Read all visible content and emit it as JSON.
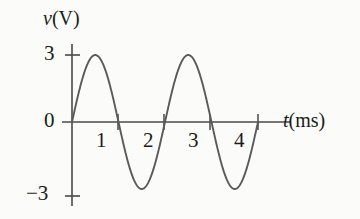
{
  "figure": {
    "background_color": "#fbfbf9",
    "ink_color": "#4a4a4a",
    "text_color": "#1b1b1b"
  },
  "labels": {
    "y_axis_title_symbol": "v",
    "y_axis_title_unit": "(V)",
    "x_axis_title_symbol": "t",
    "x_axis_title_unit": "(ms)",
    "y_tick_pos": "3",
    "y_tick_zero": "0",
    "y_tick_neg": "−3",
    "x_tick_1": "1",
    "x_tick_2": "2",
    "x_tick_3": "3",
    "x_tick_4": "4"
  },
  "chart_data": {
    "type": "line",
    "title": "",
    "subtitle": "",
    "xlabel": "t(ms)",
    "ylabel": "v(V)",
    "xlim": [
      0,
      4.6
    ],
    "ylim": [
      -3.6,
      3.6
    ],
    "xticks": [
      1,
      2,
      3,
      4
    ],
    "yticks": [
      -3,
      0,
      3
    ],
    "xtick_labels": [
      "1",
      "2",
      "3",
      "4"
    ],
    "ytick_labels": [
      "−3",
      "0",
      "3"
    ],
    "grid": false,
    "legend": null,
    "annotations": [],
    "waveform": {
      "shape": "sine",
      "amplitude_V": 3,
      "period_ms": 2,
      "frequency_kHz": 0.5,
      "phase_deg": 0,
      "offset_V": 0,
      "t_start_ms": 0,
      "t_end_ms": 4,
      "equation": "v(t) = 3 sin(π t)",
      "zero_crossings_ms": [
        0,
        1,
        2,
        3,
        4
      ],
      "peaks_ms": [
        0.5,
        2.5
      ],
      "peak_value_V": 3,
      "troughs_ms": [
        1.5,
        3.5
      ],
      "trough_value_V": -3
    },
    "series": [
      {
        "name": "v(t)",
        "x": [
          0,
          0.1,
          0.2,
          0.3,
          0.4,
          0.5,
          0.6,
          0.7,
          0.8,
          0.9,
          1.0,
          1.1,
          1.2,
          1.3,
          1.4,
          1.5,
          1.6,
          1.7,
          1.8,
          1.9,
          2.0,
          2.1,
          2.2,
          2.3,
          2.4,
          2.5,
          2.6,
          2.7,
          2.8,
          2.9,
          3.0,
          3.1,
          3.2,
          3.3,
          3.4,
          3.5,
          3.6,
          3.7,
          3.8,
          3.9,
          4.0
        ],
        "y": [
          0.0,
          0.93,
          1.76,
          2.43,
          2.85,
          3.0,
          2.85,
          2.43,
          1.76,
          0.93,
          0.0,
          -0.93,
          -1.76,
          -2.43,
          -2.85,
          -3.0,
          -2.85,
          -2.43,
          -1.76,
          -0.93,
          0.0,
          0.93,
          1.76,
          2.43,
          2.85,
          3.0,
          2.85,
          2.43,
          1.76,
          0.93,
          0.0,
          -0.93,
          -1.76,
          -2.43,
          -2.85,
          -3.0,
          -2.85,
          -2.43,
          -1.76,
          -0.93,
          0.0
        ]
      }
    ]
  }
}
